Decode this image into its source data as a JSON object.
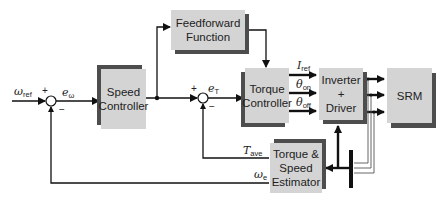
{
  "blocks": {
    "feedforward": {
      "line1": "Feedforward",
      "line2": "Function"
    },
    "speed_controller": {
      "line1": "Speed",
      "line2": "Controller"
    },
    "torque_controller": {
      "line1": "Torque",
      "line2": "Controller"
    },
    "inverter_driver": {
      "line1": "Inverter",
      "line2": "+",
      "line3": "Driver"
    },
    "srm": {
      "line1": "SRM"
    },
    "estimator": {
      "line1": "Torque &",
      "line2": "Speed",
      "line3": "Estimator"
    }
  },
  "signals": {
    "omega_ref": {
      "symbol": "ω",
      "sub": "ref"
    },
    "e_omega": {
      "symbol": "e",
      "sub": "ω"
    },
    "e_T": {
      "symbol": "e",
      "sub": "T"
    },
    "i_ref": {
      "symbol": "I",
      "sub": "ref"
    },
    "theta_on": {
      "symbol": "θ",
      "sub": "on"
    },
    "theta_off": {
      "symbol": "θ",
      "sub": "off"
    },
    "t_ave": {
      "symbol": "T",
      "sub": "ave"
    },
    "omega_e": {
      "symbol": "ω",
      "sub": "e"
    }
  },
  "signs": {
    "sum1_plus": "+",
    "sum1_minus": "−",
    "sum2_plus": "+",
    "sum2_minus": "−"
  },
  "colors": {
    "block_fill": "#d4d4d4",
    "block_shadow": "#4d4d4d",
    "wire": "#111111"
  }
}
